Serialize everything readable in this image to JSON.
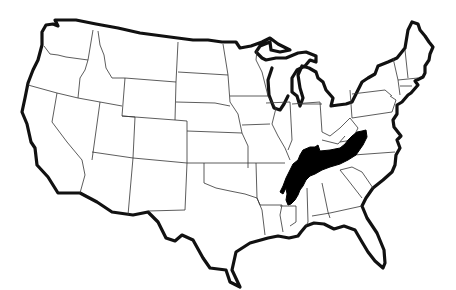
{
  "map": {
    "subject": "United States (contiguous 48 states) outline map",
    "style": "black and white line art",
    "background_color": "#ffffff",
    "outline_color": "#111111",
    "state_border_color": "#333333",
    "highlight": {
      "color": "#000000",
      "description": "Highlighted region spanning Tennessee, southern Kentucky, northern Alabama and northern Mississippi",
      "states_covered": [
        "Tennessee",
        "Kentucky",
        "Alabama",
        "Mississippi"
      ]
    },
    "labels": []
  }
}
